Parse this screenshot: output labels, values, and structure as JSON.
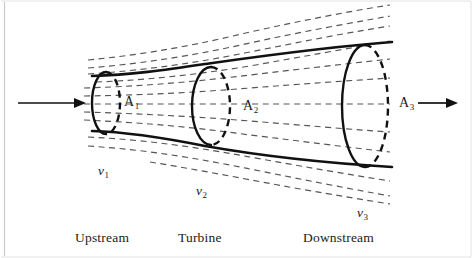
{
  "figure": {
    "background_color": "#ffffff",
    "line_color": "#111111",
    "streamline_color": "#555555",
    "width": 472,
    "height": 258
  },
  "area_labels": [
    {
      "symbol": "A",
      "subscript": "1",
      "x": 124,
      "y": 95
    },
    {
      "symbol": "A",
      "subscript": "2",
      "x": 243,
      "y": 99
    },
    {
      "symbol": "A",
      "subscript": "3",
      "x": 399,
      "y": 96
    }
  ],
  "velocity_labels": [
    {
      "symbol": "v",
      "subscript": "1",
      "x": 98,
      "y": 164
    },
    {
      "symbol": "v",
      "subscript": "2",
      "x": 196,
      "y": 184
    },
    {
      "symbol": "v",
      "subscript": "3",
      "x": 357,
      "y": 206
    }
  ],
  "region_labels": [
    {
      "text": "Upstream",
      "x": 75,
      "y": 231
    },
    {
      "text": "Turbine",
      "x": 178,
      "y": 231
    },
    {
      "text": "Downstream",
      "x": 303,
      "y": 231
    }
  ],
  "flow_arrows": [
    {
      "name": "inlet-flow-arrow",
      "x1": 18,
      "y1": 103,
      "x2": 84,
      "y2": 103
    },
    {
      "name": "outlet-flow-arrow",
      "x1": 418,
      "y1": 103,
      "x2": 456,
      "y2": 103
    }
  ],
  "disks": [
    {
      "name": "upstream-disk",
      "cx": 106,
      "cy": 103,
      "rx": 14,
      "ry": 31
    },
    {
      "name": "turbine-disk",
      "cx": 211,
      "cy": 106,
      "rx": 19,
      "ry": 39
    },
    {
      "name": "downstream-disk",
      "cx": 365,
      "cy": 106,
      "rx": 23,
      "ry": 61
    }
  ],
  "tube_edges": {
    "top": "M 92,76 C 140,74 170,68 205,64 C 260,57 320,48 392,42",
    "bottom": "M 92,131 C 140,133 170,140 205,146 C 260,155 320,163 392,167"
  },
  "streamlines": {
    "inside_count": 5,
    "above_count": 4,
    "below_count": 3
  },
  "streamline_paths": [
    "M 84,88 C 150,86 200,81 250,76 C 300,71 345,66 392,62",
    "M 84,97 C 150,96 200,93 250,90 C 300,86 345,83 392,80",
    "M 84,104 C 150,104 200,103 250,103 C 300,102 345,102 392,102",
    "M 84,112 C 150,113 200,116 250,120 C 300,124 345,127 392,130",
    "M 84,121 C 150,123 200,128 250,134 C 300,140 345,145 392,150",
    "M 88,68 C 150,64 200,55 250,45 C 300,35 345,26 392,18",
    "M 88,74 C 150,70 200,62 250,52 C 300,42 345,34 392,27",
    "M 88,60 C 150,54 200,44 250,32 C 300,21 345,12 392,5",
    "M 88,80 C 150,78 200,72 250,64 C 300,56 345,48 392,40",
    "M 88,141 C 150,145 200,154 250,164 C 300,174 345,183 392,191",
    "M 88,147 C 150,152 200,162 250,173 C 300,184 345,193 392,202",
    "M 88,136 C 150,139 200,147 250,156 C 300,165 345,173 392,180"
  ]
}
